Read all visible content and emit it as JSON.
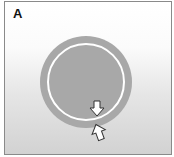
{
  "panel": {
    "label": "A"
  },
  "diagram": {
    "circle": {
      "cx": 81,
      "cy": 80,
      "r_outer": 46,
      "r_inner": 38,
      "fill": "#a8a8a8",
      "ring_color": "#ffffff"
    },
    "arrows": [
      {
        "name": "down-arrow",
        "direction": "down",
        "x": 92,
        "y": 106
      },
      {
        "name": "up-arrow",
        "direction": "up",
        "x": 94,
        "y": 131
      }
    ],
    "colors": {
      "border": "#8a8a8a",
      "bg_top": "#ffffff",
      "bg_bottom": "#d2d2d2"
    }
  }
}
